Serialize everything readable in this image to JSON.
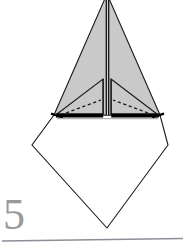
{
  "figure": {
    "kind": "origami-fold-diagram",
    "step_number": "5",
    "caption": "",
    "background_color": "#ffffff"
  },
  "palette": {
    "paper_shaded": "#c9c9c9",
    "paper_shaded_light": "#d4d4d4",
    "paper_white": "#ffffff",
    "outline": "#1a1a1a",
    "fold_crease": "#2b2b2b",
    "hidden_fold_dashed": "#1a1a1a",
    "thick_edge": "#000000",
    "step_number_color": "#9a9a9a",
    "rule_color": "#8d8d98"
  },
  "shapes": {
    "upper_shaded_kite": {
      "name": "upper-shaded-triangle",
      "points": "107,-6 160,115 54,115",
      "fill": "#c9c9c9",
      "stroke": "#1a1a1a",
      "stroke_width": 1.1
    },
    "lower_white_diamond": {
      "name": "lower-white-diamond",
      "points": "54,115 160,115 168,145 107,228 32,145",
      "fill": "#ffffff",
      "stroke": "#1a1a1a",
      "stroke_width": 1.1
    },
    "left_inner_flap": {
      "name": "left-inner-flap-triangle",
      "points": "103,79 103,114 57,114",
      "fill": "#c9c9c9",
      "stroke": "#1a1a1a",
      "stroke_width": 1.1
    },
    "right_inner_flap": {
      "name": "right-inner-flap-triangle",
      "points": "111,79 157,114 111,114",
      "fill": "#c9c9c9",
      "stroke": "#1a1a1a",
      "stroke_width": 1.1
    },
    "center_gap": {
      "name": "center-vertical-gap",
      "points": "105.5,0 108.7,0 108.7,115 105.5,115",
      "fill": "#ffffff"
    }
  },
  "creases": [
    {
      "name": "center-crease-left",
      "x1": 106.3,
      "y1": -4,
      "x2": 106.3,
      "y2": 115,
      "width": 1.5,
      "style": "solid"
    },
    {
      "name": "center-crease-right",
      "x1": 108.6,
      "y1": -4,
      "x2": 108.6,
      "y2": 115,
      "width": 1.5,
      "style": "solid"
    },
    {
      "name": "left-flap-edge",
      "x1": 103.2,
      "y1": 79,
      "x2": 103.2,
      "y2": 114,
      "width": 1.2,
      "style": "solid"
    },
    {
      "name": "right-flap-edge",
      "x1": 111.2,
      "y1": 79,
      "x2": 111.2,
      "y2": 114,
      "width": 1.2,
      "style": "solid"
    }
  ],
  "dashed_folds": [
    {
      "name": "left-hidden-fold-dashed",
      "x1": 66,
      "y1": 113,
      "x2": 101,
      "y2": 100,
      "dash": "3.2,2.6",
      "width": 1.3
    },
    {
      "name": "right-hidden-fold-dashed",
      "x1": 148,
      "y1": 113,
      "x2": 113,
      "y2": 100,
      "dash": "3.2,2.6",
      "width": 1.3
    }
  ],
  "thick_edges": [
    {
      "name": "base-thick-bar-left",
      "x1": 55,
      "y1": 115.5,
      "x2": 103,
      "y2": 115.5,
      "width": 4.0
    },
    {
      "name": "base-thick-bar-right",
      "x1": 111,
      "y1": 115.5,
      "x2": 160,
      "y2": 115.5,
      "width": 4.0
    },
    {
      "name": "base-edge-left-tip",
      "x1": 51,
      "y1": 114.0,
      "x2": 62,
      "y2": 117.5,
      "width": 2.2
    },
    {
      "name": "base-edge-right-tip",
      "x1": 163,
      "y1": 114.0,
      "x2": 152,
      "y2": 117.5,
      "width": 2.2
    }
  ],
  "rule": {
    "name": "bottom-separator-rule",
    "x1": 2,
    "y1": 241,
    "x2": 183,
    "y2": 238,
    "color": "#8d8d98",
    "width": 1.4
  }
}
